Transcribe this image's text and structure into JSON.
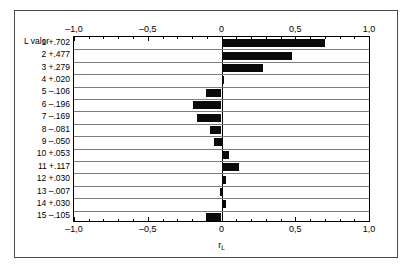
{
  "chart_data": {
    "type": "bar",
    "orientation": "horizontal",
    "title": "",
    "xlabel": "r_L",
    "xlabel_base": "r",
    "xlabel_sub": "L",
    "ylabel": "L",
    "column_header": "L valor",
    "xlim": [
      -1.0,
      1.0
    ],
    "xticks": [
      -1.0,
      -0.5,
      0.0,
      0.5,
      1.0
    ],
    "xticklabels": [
      "–1,0",
      "–0,5",
      "0",
      "0,5",
      "1,0"
    ],
    "minor_ticks_per_interval": 5,
    "grid": "horizontal",
    "legend": "none",
    "axis_labels_position": "top-and-bottom",
    "categories": [
      "1",
      "2",
      "3",
      "4",
      "5",
      "6",
      "7",
      "8",
      "9",
      "10",
      "11",
      "12",
      "13",
      "14",
      "15"
    ],
    "values": [
      0.702,
      0.477,
      0.279,
      0.02,
      -0.106,
      -0.196,
      -0.169,
      -0.081,
      -0.05,
      0.053,
      0.117,
      0.03,
      -0.007,
      0.03,
      -0.105
    ],
    "value_labels": [
      "+.702",
      "+.477",
      "+.279",
      "+.020",
      "–.106",
      "–.196",
      "–.169",
      "–.081",
      "–.050",
      "+.053",
      "+.117",
      "+.030",
      "–.007",
      "+.030",
      "–.105"
    ],
    "rows": [
      {
        "lag": "1",
        "value_label": "+.702",
        "value": 0.702,
        "row_label": "1 +.702"
      },
      {
        "lag": "2",
        "value_label": "+.477",
        "value": 0.477,
        "row_label": "2 +.477"
      },
      {
        "lag": "3",
        "value_label": "+.279",
        "value": 0.279,
        "row_label": "3 +.279"
      },
      {
        "lag": "4",
        "value_label": "+.020",
        "value": 0.02,
        "row_label": "4 +.020"
      },
      {
        "lag": "5",
        "value_label": "–.106",
        "value": -0.106,
        "row_label": "5 –.106"
      },
      {
        "lag": "6",
        "value_label": "–.196",
        "value": -0.196,
        "row_label": "6 –.196"
      },
      {
        "lag": "7",
        "value_label": "–.169",
        "value": -0.169,
        "row_label": "7 –.169"
      },
      {
        "lag": "8",
        "value_label": "–.081",
        "value": -0.081,
        "row_label": "8 –.081"
      },
      {
        "lag": "9",
        "value_label": "–.050",
        "value": -0.05,
        "row_label": "9 –.050"
      },
      {
        "lag": "10",
        "value_label": "+.053",
        "value": 0.053,
        "row_label": "10 +.053"
      },
      {
        "lag": "11",
        "value_label": "+.117",
        "value": 0.117,
        "row_label": "11 +.117"
      },
      {
        "lag": "12",
        "value_label": "+.030",
        "value": 0.03,
        "row_label": "12 +.030"
      },
      {
        "lag": "13",
        "value_label": "–.007",
        "value": -0.007,
        "row_label": "13 –.007"
      },
      {
        "lag": "14",
        "value_label": "+.030",
        "value": 0.03,
        "row_label": "14 +.030"
      },
      {
        "lag": "15",
        "value_label": "–.105",
        "value": -0.105,
        "row_label": "15 –.105"
      }
    ],
    "colors": {
      "bar": "#0a0a0a",
      "gridline": "#7d7d7d",
      "axis": "#000000",
      "background": "#ffffff",
      "frame": "#4a4a4a"
    }
  }
}
